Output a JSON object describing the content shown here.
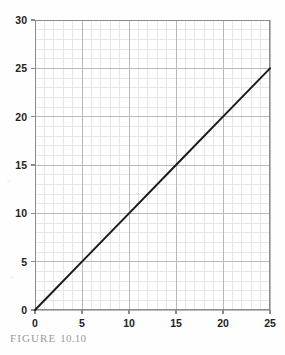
{
  "figure": {
    "caption_prefix": "FIGURE",
    "caption_number": "10.10"
  },
  "chart_data": {
    "type": "line",
    "title": "",
    "subtitle": "",
    "xlabel": "",
    "ylabel": "",
    "xlim": [
      0,
      25
    ],
    "ylim": [
      0,
      30
    ],
    "xticks": [
      0,
      5,
      10,
      15,
      20,
      25
    ],
    "yticks": [
      0,
      5,
      10,
      15,
      20,
      25,
      30
    ],
    "xtick_labels": [
      "0",
      "5",
      "10",
      "15",
      "20",
      "25"
    ],
    "ytick_labels": [
      "0",
      "5",
      "10",
      "15",
      "20",
      "25",
      "30"
    ],
    "grid": true,
    "grid_minor": true,
    "minor_divisions_per_major": 5,
    "legend": false,
    "legend_position": "none",
    "annotations": [],
    "series": [
      {
        "name": "y = x",
        "x": [
          0,
          5,
          10,
          15,
          20,
          25
        ],
        "values": [
          0,
          5,
          10,
          15,
          20,
          25
        ],
        "color": "#1a1a1a",
        "line_width": 2
      }
    ]
  },
  "colors": {
    "axis": "#8c8c8c",
    "grid_major": "#b9b9bd",
    "grid_minor": "#e6e6ea",
    "data_line": "#1a1a1a",
    "tick_text": "#232323",
    "caption_text": "#9a9a9a",
    "background": "#fefefe",
    "plot_background": "#ffffff"
  }
}
